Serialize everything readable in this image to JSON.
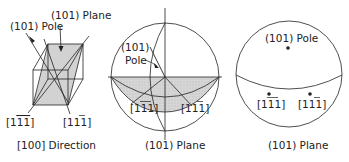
{
  "panels": [
    {
      "id": "cube",
      "caption": "[100] Direction",
      "labels": {
        "pole": "(101) Pole",
        "plane": "(101) Plane",
        "dir_left": "[1",
        "dir_left_bar": "11",
        "dir_left_end": "]",
        "dir_right": "[11",
        "dir_right_bar": "1",
        "dir_right_end": "]"
      }
    },
    {
      "id": "stereo-projection",
      "caption": "(101) Plane",
      "labels": {
        "pole_line1": "(101)",
        "pole_line2": "Pole",
        "dir_left": "[1",
        "dir_left_bar": "11",
        "dir_left_end": "]",
        "dir_right": "[11",
        "dir_right_bar": "1",
        "dir_right_end": "]"
      }
    },
    {
      "id": "stereogram",
      "caption": "(101) Plane",
      "labels": {
        "pole": "(101) Pole",
        "dir_left": "[1",
        "dir_left_bar": "11",
        "dir_left_end": "]",
        "dir_right": "[11",
        "dir_right_bar": "1",
        "dir_right_end": "]"
      }
    }
  ],
  "colors": {
    "line": "#222222",
    "shade": "#d4d4d4"
  }
}
